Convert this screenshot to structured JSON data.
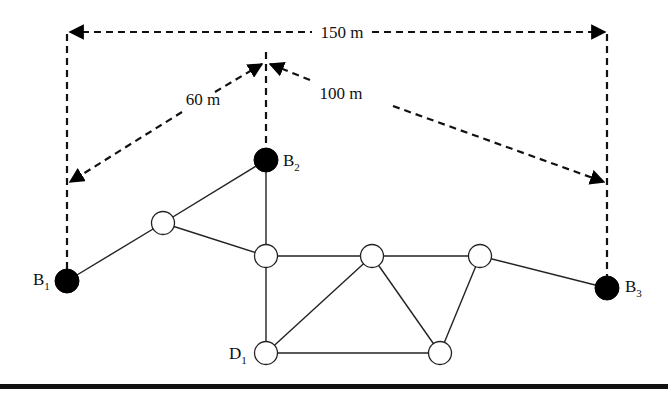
{
  "diagram": {
    "type": "network",
    "dimensions": {
      "total_width": "150 m",
      "left_diagonal": "60 m",
      "right_diagonal": "100 m"
    },
    "nodes": [
      {
        "id": "B1",
        "label": "B",
        "sub": "1",
        "kind": "filled"
      },
      {
        "id": "B2",
        "label": "B",
        "sub": "2",
        "kind": "filled"
      },
      {
        "id": "B3",
        "label": "B",
        "sub": "3",
        "kind": "filled"
      },
      {
        "id": "D1",
        "label": "D",
        "sub": "1",
        "kind": "open"
      },
      {
        "id": "N1",
        "label": "",
        "kind": "open"
      },
      {
        "id": "N2",
        "label": "",
        "kind": "open"
      },
      {
        "id": "N3",
        "label": "",
        "kind": "open"
      },
      {
        "id": "N4",
        "label": "",
        "kind": "open"
      },
      {
        "id": "N5",
        "label": "",
        "kind": "open"
      }
    ],
    "edges": [
      [
        "B1",
        "N1"
      ],
      [
        "N1",
        "B2"
      ],
      [
        "N1",
        "N2"
      ],
      [
        "B2",
        "N2"
      ],
      [
        "N2",
        "N3"
      ],
      [
        "N3",
        "N4"
      ],
      [
        "N4",
        "B3"
      ],
      [
        "N2",
        "D1"
      ],
      [
        "D1",
        "N3"
      ],
      [
        "D1",
        "N5"
      ],
      [
        "N3",
        "N5"
      ],
      [
        "N4",
        "N5"
      ]
    ]
  }
}
